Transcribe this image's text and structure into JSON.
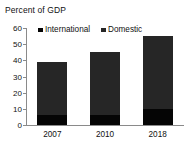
{
  "chart_data": {
    "type": "bar",
    "subtype": "stacked-vertical",
    "title": "Percent of GDP",
    "xlabel": "",
    "ylabel": "",
    "categories": [
      "2007",
      "2010",
      "2018"
    ],
    "series": [
      {
        "name": "International",
        "values": [
          6,
          6,
          10
        ],
        "color": "#050505"
      },
      {
        "name": "Domestic",
        "values": [
          33,
          39,
          45
        ],
        "color": "#262626"
      }
    ],
    "totals": [
      39,
      45,
      55
    ],
    "ylim": [
      0,
      60
    ],
    "yticks": [
      0,
      10,
      20,
      30,
      40,
      50,
      60
    ],
    "ytick_labels": [
      "0",
      "10",
      "20",
      "30",
      "40",
      "50",
      "60"
    ],
    "grid": false,
    "legend_position": "top-inside"
  },
  "legend": {
    "entries": [
      {
        "label": "International",
        "marker": "square-marker",
        "color": "#050505"
      },
      {
        "label": "Domestic",
        "marker": "square-marker",
        "color": "#262626"
      }
    ]
  },
  "axes": {
    "axis_color": "#8a8a8a"
  }
}
